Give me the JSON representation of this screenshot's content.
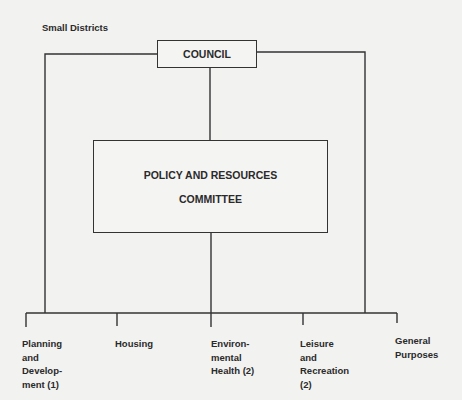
{
  "title": "Small Districts",
  "council": {
    "label": "COUNCIL"
  },
  "policy_committee": {
    "line1": "POLICY AND RESOURCES",
    "line2": "COMMITTEE"
  },
  "committees": [
    {
      "label": "Planning\nand\nDevelop-\nment (1)"
    },
    {
      "label": "Housing"
    },
    {
      "label": "Environ-\nmental\nHealth (2)"
    },
    {
      "label": "Leisure\nand\nRecreation\n(2)"
    },
    {
      "label": "General\nPurposes"
    }
  ],
  "colors": {
    "line": "#333333",
    "background": "#f2f2f0"
  }
}
